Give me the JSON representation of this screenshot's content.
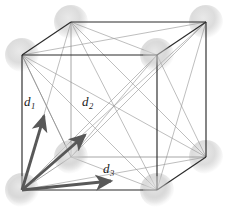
{
  "figure": {
    "type": "crystal-lattice-diagram",
    "colors": {
      "cube_edge": "#2b2b2b",
      "cube_edge_hidden": "#8a8a8a",
      "diagonal_line": "#9a9a9a",
      "atom_sphere": "#d9d9d9",
      "vector_arrow": "#585858",
      "label_text": "#1a1a1a",
      "background": "#ffffff"
    },
    "vectors": [
      {
        "id": "d1",
        "letter": "d",
        "subscript": "1",
        "label_x": 24,
        "label_y": 98,
        "from": [
          22,
          190
        ],
        "to": [
          46,
          112
        ]
      },
      {
        "id": "d2",
        "letter": "d",
        "subscript": "2",
        "label_x": 82,
        "label_y": 98,
        "from": [
          22,
          190
        ],
        "to": [
          89,
          131
        ]
      },
      {
        "id": "d3",
        "letter": "d",
        "subscript": "3",
        "label_x": 102,
        "label_y": 164,
        "from": [
          22,
          190
        ],
        "to": [
          117,
          180
        ]
      }
    ],
    "cube_vertices": {
      "front_top_left": [
        22,
        55
      ],
      "front_top_right": [
        157,
        55
      ],
      "front_bottom_left": [
        22,
        190
      ],
      "front_bottom_right": [
        157,
        190
      ],
      "back_top_left": [
        71,
        22
      ],
      "back_top_right": [
        206,
        22
      ],
      "back_bottom_left": [
        71,
        157
      ],
      "back_bottom_right": [
        206,
        157
      ]
    },
    "atom_positions": [
      [
        22,
        55
      ],
      [
        71,
        22
      ],
      [
        206,
        22
      ],
      [
        157,
        55
      ],
      [
        22,
        190
      ],
      [
        157,
        190
      ],
      [
        206,
        157
      ],
      [
        71,
        157
      ]
    ]
  }
}
